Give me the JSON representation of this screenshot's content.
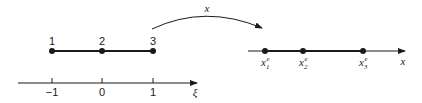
{
  "diagram": {
    "type": "isoparametric-mapping",
    "colors": {
      "stroke": "#1a1a1a",
      "background": "#ffffff"
    },
    "parent_element": {
      "nodes": [
        {
          "label": "1",
          "xi": -1
        },
        {
          "label": "2",
          "xi": 0
        },
        {
          "label": "3",
          "xi": 1
        }
      ]
    },
    "xi_axis": {
      "label": "ξ",
      "ticks": [
        "−1",
        "0",
        "1"
      ]
    },
    "mapping": {
      "label": "x"
    },
    "physical_element": {
      "axis_label": "x",
      "nodes": [
        {
          "base": "x",
          "sub": "1",
          "sup": "e"
        },
        {
          "base": "x",
          "sub": "2",
          "sup": "e"
        },
        {
          "base": "x",
          "sub": "3",
          "sup": "e"
        }
      ]
    }
  }
}
